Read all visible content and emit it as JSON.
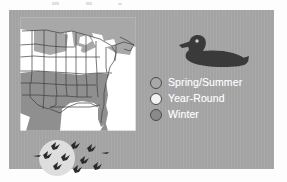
{
  "figure": {
    "panel_color": "#a6a6a6",
    "map_background": "#ffffff"
  },
  "map": {
    "name": "united-states-range-map",
    "region": "Central and Eastern United States",
    "zone_colors": {
      "spring_summer": "#a8a8a8",
      "year_round": "#ffffff",
      "winter": "#8f8f8f"
    },
    "outline_color": "#3d3d3d",
    "water_color": "#ffffff"
  },
  "duck": {
    "name": "duck-silhouette",
    "body_color": "#3a3a3a",
    "eye_color": "#cfcfcf",
    "facing": "left"
  },
  "legend": {
    "items": [
      {
        "label": "Spring/Summer",
        "color": "#a8a8a8",
        "outline": "#4b4b4b"
      },
      {
        "label": "Year-Round",
        "color": "#f2f2f2",
        "outline": "#4b4b4b"
      },
      {
        "label": "Winter",
        "color": "#8a8a8a",
        "outline": "#4b4b4b"
      }
    ],
    "text_color": "#ffffff"
  },
  "flock": {
    "name": "migrating-birds-over-moon",
    "moon_color": "#dedede",
    "bird_color": "#2b2b2b",
    "bird_count": 9
  }
}
